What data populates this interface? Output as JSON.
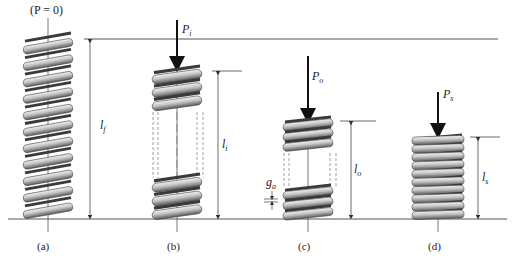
{
  "figure": {
    "top_label": "(P = 0)",
    "panels": [
      {
        "id": "a",
        "caption": "(a)",
        "load_label": "",
        "length_label": {
          "main": "l",
          "sub": "f"
        }
      },
      {
        "id": "b",
        "caption": "(b)",
        "load_label": {
          "main": "P",
          "sub": "i"
        },
        "length_label": {
          "main": "l",
          "sub": "i"
        }
      },
      {
        "id": "c",
        "caption": "(c)",
        "load_label": {
          "main": "P",
          "sub": "o"
        },
        "length_label": {
          "main": "l",
          "sub": "o"
        },
        "gap_label": {
          "main": "g",
          "sub": "a"
        }
      },
      {
        "id": "d",
        "caption": "(d)",
        "load_label": {
          "main": "P",
          "sub": "s"
        },
        "length_label": {
          "main": "l",
          "sub": "s"
        }
      }
    ],
    "colors": {
      "line": "#333333",
      "spring_light": "#e6e6e6",
      "spring_mid": "#a9a9a9",
      "spring_dark": "#4a4a4a",
      "background": "#ffffff"
    }
  }
}
